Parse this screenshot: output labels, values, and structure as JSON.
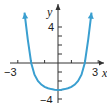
{
  "chart_data": {
    "type": "line",
    "title": "",
    "xlabel": "x",
    "ylabel": "y",
    "xlim": [
      -3.2,
      3.3
    ],
    "ylim": [
      -4,
      5.8
    ],
    "x_ticks": [
      -3,
      -2,
      -1,
      0,
      1,
      2,
      3
    ],
    "y_ticks": [
      -4,
      -3,
      -2,
      -1,
      0,
      1,
      2,
      3,
      4
    ],
    "x_tick_labels": {
      "-3": "−3",
      "3": "3"
    },
    "y_tick_labels": {
      "4": "4",
      "-4": "−4"
    },
    "grid": false,
    "legend": null,
    "series": [
      {
        "name": "curve",
        "color": "#3a9fd0",
        "arrows_at_ends": true,
        "x": [
          -2.5,
          -2.25,
          -2.0,
          -1.75,
          -1.5,
          -1.25,
          -1.0,
          -0.75,
          -0.5,
          -0.25,
          0,
          0.25,
          0.5,
          0.75,
          1.0,
          1.25,
          1.5,
          1.75,
          2.0,
          2.25,
          2.5
        ],
        "y": [
          5.6,
          2.6,
          0.0,
          -1.3,
          -2.0,
          -2.4,
          -2.65,
          -2.8,
          -2.9,
          -2.97,
          -3.0,
          -2.97,
          -2.9,
          -2.8,
          -2.65,
          -2.4,
          -2.0,
          -1.3,
          0.0,
          2.6,
          5.6
        ]
      }
    ]
  },
  "labels": {
    "x_axis": "x",
    "y_axis": "y",
    "x_min": "−3",
    "x_max": "3",
    "y_max": "4",
    "y_min": "−4"
  }
}
